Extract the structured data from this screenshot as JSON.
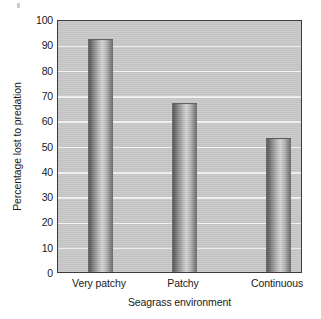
{
  "chart_data": {
    "type": "bar",
    "title": "",
    "categories": [
      "Very patchy",
      "Patchy",
      "Continuous"
    ],
    "values": [
      92,
      67,
      53
    ],
    "xlabel": "Seagrass environment",
    "ylabel": "Percentage lost to predation",
    "ylim": [
      0,
      100
    ],
    "yticks": [
      0,
      10,
      20,
      30,
      40,
      50,
      60,
      70,
      80,
      90,
      100
    ],
    "ytick_labels": [
      "0",
      "10",
      "20",
      "30",
      "40",
      "50",
      "60",
      "70",
      "80",
      "90",
      "100"
    ],
    "grid": "horizontal",
    "legend": "none",
    "colors": {
      "plot_background": "#c9c9c9",
      "gridline": "#f2f2f2",
      "bar_fill": "#9a9a9a",
      "axis": "#3c3c3c",
      "text": "#1a1a1a",
      "figure_background": "#ffffff"
    }
  }
}
